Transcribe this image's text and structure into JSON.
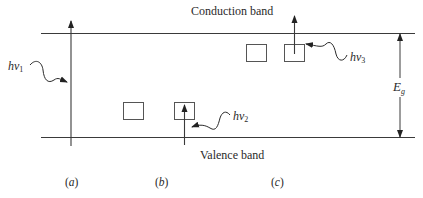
{
  "diagram": {
    "bands": {
      "conduction": {
        "label": "Conduction band"
      },
      "valence": {
        "label": "Valence band"
      }
    },
    "gap": {
      "symbol": "E",
      "subscript": "g"
    },
    "photons": [
      {
        "id": "hv1",
        "symbol": "hν",
        "subscript": "1",
        "panel": "a"
      },
      {
        "id": "hv2",
        "symbol": "hν",
        "subscript": "2",
        "panel": "b"
      },
      {
        "id": "hv3",
        "symbol": "hν",
        "subscript": "3",
        "panel": "c"
      }
    ],
    "panels": [
      {
        "id": "a",
        "open": "(",
        "letter": "a",
        "close": ")"
      },
      {
        "id": "b",
        "open": "(",
        "letter": "b",
        "close": ")"
      },
      {
        "id": "c",
        "open": "(",
        "letter": "c",
        "close": ")"
      }
    ],
    "colors": {
      "line": "#3a3a3a",
      "text": "#2a2a2a",
      "background": "#ffffff"
    }
  }
}
